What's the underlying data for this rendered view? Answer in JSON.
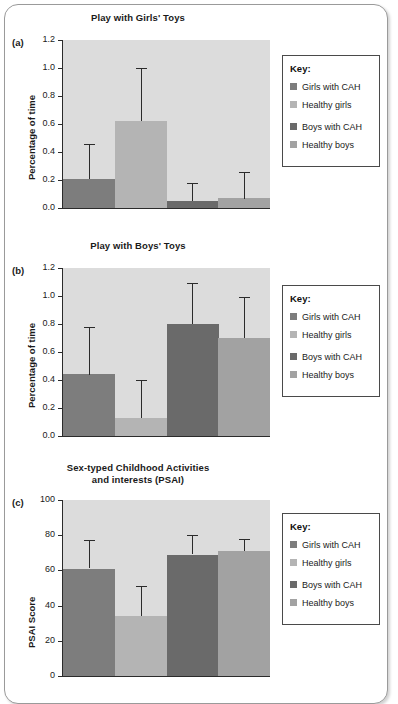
{
  "figure": {
    "background_color": "#ffffff",
    "frame_border_color": "#9a9a9a"
  },
  "legend": {
    "title": "Key:",
    "items": [
      {
        "label": "Girls with CAH",
        "color": "#7d7d7d"
      },
      {
        "label": "Healthy girls",
        "color": "#b4b4b4"
      },
      {
        "label": "Boys with CAH",
        "color": "#6a6a6a"
      },
      {
        "label": "Healthy boys",
        "color": "#a2a2a2"
      }
    ]
  },
  "chart_data": [
    {
      "panel": "(a)",
      "type": "bar",
      "title": "Play with Girls' Toys",
      "xlabel": "",
      "ylabel": "Percentage of time",
      "ylim": [
        0.0,
        1.2
      ],
      "yticks": [
        "0.0",
        "0.2",
        "0.4",
        "0.6",
        "0.8",
        "1.0",
        "1.2"
      ],
      "grid": false,
      "legend_position": "right",
      "categories": [
        "Girls with CAH",
        "Healthy girls",
        "Boys with CAH",
        "Healthy boys"
      ],
      "values": [
        0.21,
        0.62,
        0.05,
        0.07
      ],
      "errors_upper": [
        0.46,
        1.0,
        0.18,
        0.26
      ],
      "colors": [
        "#7d7d7d",
        "#b4b4b4",
        "#6a6a6a",
        "#a2a2a2"
      ],
      "plot_background": "#dcdcdc"
    },
    {
      "panel": "(b)",
      "type": "bar",
      "title": "Play with Boys' Toys",
      "xlabel": "",
      "ylabel": "Percentage of time",
      "ylim": [
        0.0,
        1.2
      ],
      "yticks": [
        "0.0",
        "0.2",
        "0.4",
        "0.6",
        "0.8",
        "1.0",
        "1.2"
      ],
      "grid": false,
      "legend_position": "right",
      "categories": [
        "Girls with CAH",
        "Healthy girls",
        "Boys with CAH",
        "Healthy boys"
      ],
      "values": [
        0.44,
        0.13,
        0.8,
        0.7
      ],
      "errors_upper": [
        0.78,
        0.4,
        1.09,
        0.99
      ],
      "colors": [
        "#7d7d7d",
        "#b4b4b4",
        "#6a6a6a",
        "#a2a2a2"
      ],
      "plot_background": "#dcdcdc"
    },
    {
      "panel": "(c)",
      "type": "bar",
      "title": "Sex-typed Childhood Activities and interests (PSAI)",
      "title_line1": "Sex-typed Childhood Activities",
      "title_line2": "and interests (PSAI)",
      "xlabel": "",
      "ylabel": "PSAI Score",
      "ylim": [
        0,
        100
      ],
      "yticks": [
        "0",
        "20",
        "40",
        "60",
        "80",
        "100"
      ],
      "grid": false,
      "legend_position": "right",
      "categories": [
        "Girls with CAH",
        "Healthy girls",
        "Boys with CAH",
        "Healthy boys"
      ],
      "values": [
        61,
        34,
        69,
        71
      ],
      "errors_upper": [
        77,
        51,
        80,
        78
      ],
      "colors": [
        "#7d7d7d",
        "#b4b4b4",
        "#6a6a6a",
        "#a2a2a2"
      ],
      "plot_background": "#dcdcdc"
    }
  ]
}
